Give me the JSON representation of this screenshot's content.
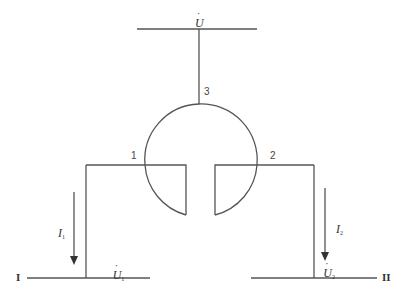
{
  "diagram": {
    "type": "substation-busbar-connection",
    "top_bus": {
      "voltage_label": "U",
      "voltage_dot": true
    },
    "nodes": [
      {
        "id": "1",
        "label": "1"
      },
      {
        "id": "2",
        "label": "2"
      },
      {
        "id": "3",
        "label": "3"
      }
    ],
    "branches": [
      {
        "current_label": "I",
        "current_sub": "1",
        "direction": "down"
      },
      {
        "current_label": "I",
        "current_sub": "2",
        "direction": "down"
      }
    ],
    "buses": [
      {
        "name": "I",
        "voltage_label": "U",
        "voltage_sub": "1"
      },
      {
        "name": "II",
        "voltage_label": "U",
        "voltage_sub": "2"
      }
    ],
    "colors": {
      "line": "#555555",
      "background": "#ffffff"
    }
  }
}
